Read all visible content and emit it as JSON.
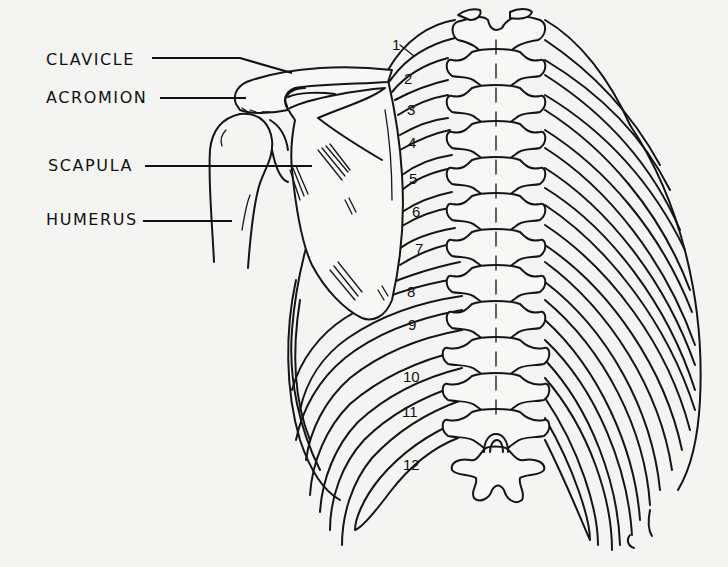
{
  "figure": {
    "type": "anatomical line drawing",
    "view": "posterior thorax with right shoulder girdle",
    "background_color": "#f4f4f2",
    "line_color": "#151515"
  },
  "labels": [
    {
      "id": "clavicle",
      "text": "CLAVICLE",
      "x": 46,
      "y": 55
    },
    {
      "id": "acromion",
      "text": "ACROMION",
      "x": 46,
      "y": 91
    },
    {
      "id": "scapula",
      "text": "SCAPULA",
      "x": 48,
      "y": 157
    },
    {
      "id": "humerus",
      "text": "HUMERUS",
      "x": 46,
      "y": 211
    }
  ],
  "rib_numbers": [
    {
      "n": "1",
      "x": 392,
      "y": 37
    },
    {
      "n": "2",
      "x": 404,
      "y": 71
    },
    {
      "n": "3",
      "x": 407,
      "y": 102
    },
    {
      "n": "4",
      "x": 408,
      "y": 135
    },
    {
      "n": "5",
      "x": 409,
      "y": 171
    },
    {
      "n": "6",
      "x": 412,
      "y": 204
    },
    {
      "n": "7",
      "x": 415,
      "y": 241
    },
    {
      "n": "8",
      "x": 407,
      "y": 284
    },
    {
      "n": "9",
      "x": 408,
      "y": 317
    },
    {
      "n": "10",
      "x": 403,
      "y": 369
    },
    {
      "n": "11",
      "x": 402,
      "y": 404
    },
    {
      "n": "12",
      "x": 403,
      "y": 457
    }
  ]
}
